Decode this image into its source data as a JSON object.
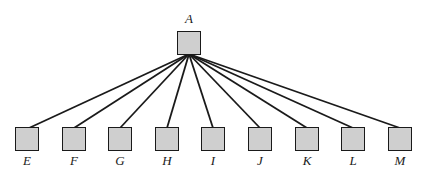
{
  "diagram": {
    "type": "tree",
    "root": {
      "id": "A",
      "label": "A",
      "x": 177,
      "y": 31,
      "label_y": 12
    },
    "children": [
      {
        "id": "E",
        "label": "E",
        "x": 15,
        "y": 127,
        "attach_x": 29
      },
      {
        "id": "F",
        "label": "F",
        "x": 62,
        "y": 127,
        "attach_x": 74
      },
      {
        "id": "G",
        "label": "G",
        "x": 108,
        "y": 127,
        "attach_x": 120
      },
      {
        "id": "H",
        "label": "H",
        "x": 155,
        "y": 127,
        "attach_x": 167
      },
      {
        "id": "I",
        "label": "I",
        "x": 201,
        "y": 127,
        "attach_x": 213
      },
      {
        "id": "J",
        "label": "J",
        "x": 248,
        "y": 127,
        "attach_x": 260
      },
      {
        "id": "K",
        "label": "K",
        "x": 295,
        "y": 127,
        "attach_x": 307
      },
      {
        "id": "L",
        "label": "L",
        "x": 341,
        "y": 127,
        "attach_x": 353
      },
      {
        "id": "M",
        "label": "M",
        "x": 388,
        "y": 127,
        "attach_x": 400
      }
    ],
    "colors": {
      "stroke": "#1a1a1a",
      "fill": "#cfcfcf"
    }
  }
}
